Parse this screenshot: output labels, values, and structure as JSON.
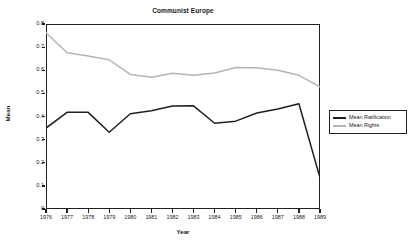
{
  "chart_data": {
    "type": "line",
    "title": "Communist Europe",
    "xlabel": "Year",
    "ylabel": "Mean",
    "x": [
      1976,
      1977,
      1978,
      1979,
      1980,
      1981,
      1982,
      1983,
      1984,
      1985,
      1986,
      1987,
      1988,
      1989
    ],
    "xticklabels": [
      "1976",
      "1977",
      "1978",
      "1979",
      "1980",
      "1981",
      "1982",
      "1983",
      "1984",
      "1985",
      "1986",
      "1987",
      "1988",
      "1989"
    ],
    "yticklabels": [
      "0.8",
      "0.7",
      "0.6",
      "0.5",
      "0.4",
      "0.3",
      "0.2",
      "0.1",
      "0"
    ],
    "yticks": [
      0.8,
      0.7,
      0.6,
      0.5,
      0.4,
      0.3,
      0.2,
      0.1,
      0
    ],
    "ylim": [
      0,
      0.8
    ],
    "xlim": [
      1976,
      1989
    ],
    "grid": false,
    "legend_position": "right-outside",
    "series": [
      {
        "name": "Mean Ratification",
        "color": "#231f20",
        "values": [
          0.35,
          0.418,
          0.418,
          0.332,
          0.412,
          0.425,
          0.445,
          0.446,
          0.371,
          0.38,
          0.415,
          0.432,
          0.455,
          0.135
        ]
      },
      {
        "name": "Mean Rights",
        "color": "#b5b5b5",
        "values": [
          0.762,
          0.676,
          0.662,
          0.645,
          0.582,
          0.57,
          0.587,
          0.578,
          0.588,
          0.612,
          0.611,
          0.6,
          0.578,
          0.528
        ]
      }
    ]
  },
  "legend": {
    "items": [
      {
        "label": "Mean Ratification",
        "color": "#231f20"
      },
      {
        "label": "Mean Rights",
        "color": "#b5b5b5"
      }
    ]
  }
}
